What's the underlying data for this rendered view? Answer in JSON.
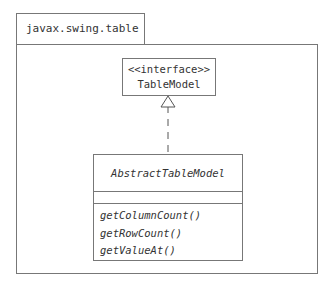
{
  "package": {
    "name": "javax.swing.table"
  },
  "interface": {
    "stereotype": "<<interface>>",
    "name": "TableModel"
  },
  "class": {
    "name": "AbstractTableModel",
    "abstract": true,
    "attributes": [],
    "operations": [
      "getColumnCount()",
      "getRowCount()",
      "getValueAt()"
    ]
  },
  "relationship": {
    "type": "realization",
    "from": "AbstractTableModel",
    "to": "TableModel"
  }
}
